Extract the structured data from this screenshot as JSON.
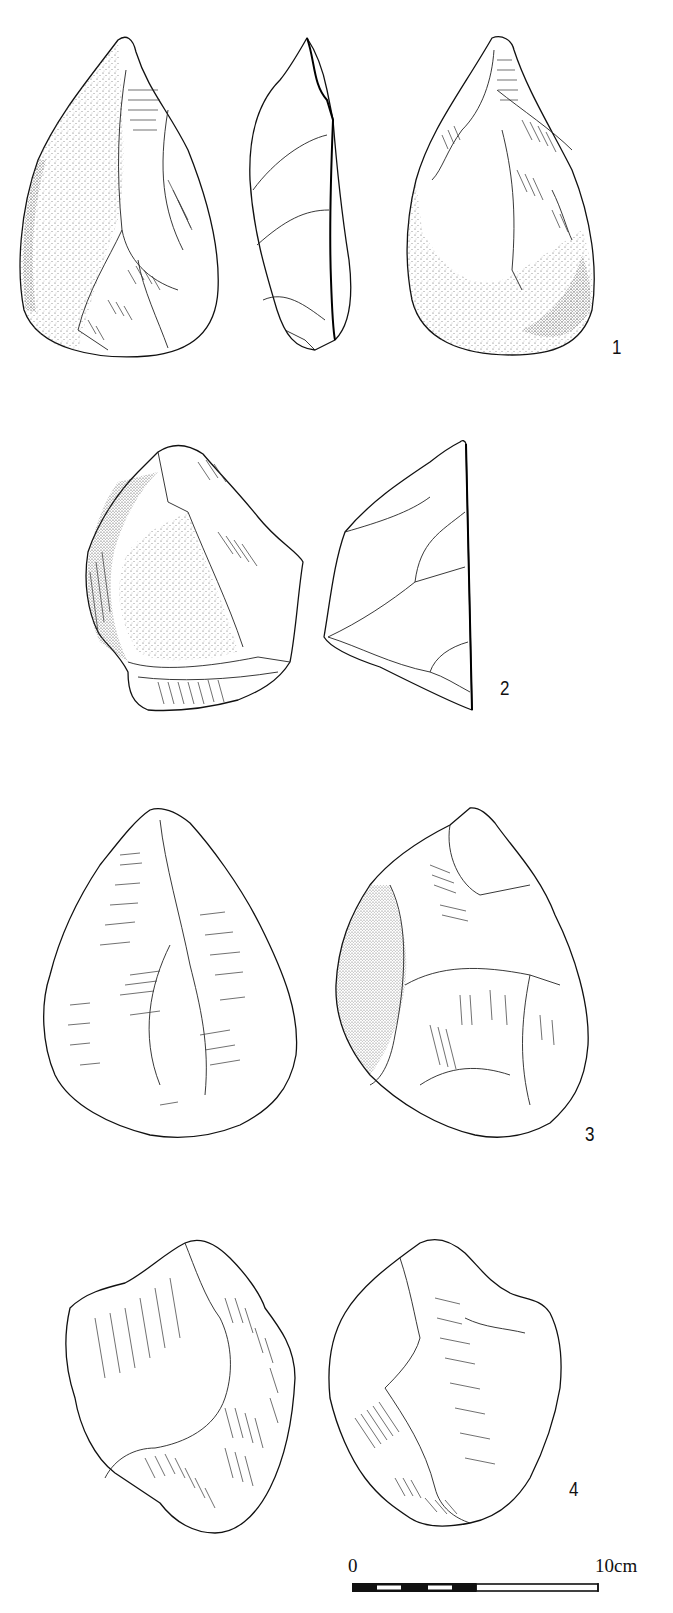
{
  "plate": {
    "type": "archaeological lithic illustration",
    "figures": [
      {
        "number": "1",
        "label": "1",
        "views": [
          "face-a",
          "profile",
          "face-b"
        ],
        "artifact": "handaxe"
      },
      {
        "number": "2",
        "label": "2",
        "views": [
          "face-a",
          "profile"
        ],
        "artifact": "handaxe"
      },
      {
        "number": "3",
        "label": "3",
        "views": [
          "face-a",
          "face-b"
        ],
        "artifact": "handaxe"
      },
      {
        "number": "4",
        "label": "4",
        "views": [
          "face-a",
          "face-b"
        ],
        "artifact": "handaxe"
      }
    ]
  },
  "scale_bar": {
    "start_label": "0",
    "end_label": "10",
    "unit": "cm",
    "end_text": "10cm",
    "segments": [
      "black",
      "white",
      "black",
      "white",
      "black",
      "open"
    ]
  },
  "colors": {
    "ink": "#111111",
    "paper": "#ffffff"
  }
}
